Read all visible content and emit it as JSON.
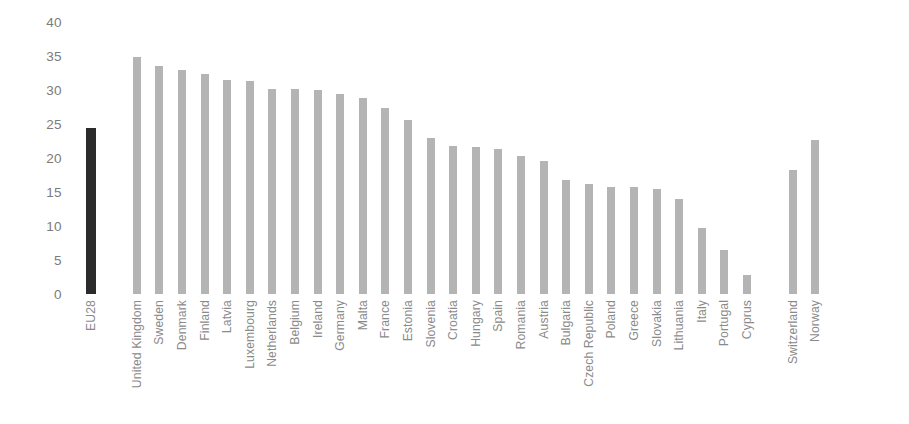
{
  "chart_data": {
    "type": "bar",
    "title": "",
    "subtitle": "",
    "xlabel": "",
    "ylabel": "",
    "ylim": [
      0,
      40
    ],
    "ytick_step": 5,
    "yticks": [
      40,
      35,
      30,
      25,
      20,
      15,
      10,
      5,
      0
    ],
    "ytick_labels": [
      "40",
      "35",
      "30",
      "25",
      "20",
      "15",
      "10",
      "5",
      "0"
    ],
    "grid": false,
    "legend": null,
    "legend_position": "none",
    "orientation": "vertical",
    "tick_label_rotation": -90,
    "colors": {
      "bar": "#b4b4b4",
      "highlight_bar": "#2b2b2b",
      "axis_text": "#7b7b7b",
      "tick_text": "#8a8a8a",
      "background": "#ffffff"
    },
    "categories": [
      "EU28",
      "United Kingdom",
      "Sweden",
      "Denmark",
      "Finland",
      "Latvia",
      "Luxembourg",
      "Netherlands",
      "Belgium",
      "Ireland",
      "Germany",
      "Malta",
      "France",
      "Estonia",
      "Slovenia",
      "Croatia",
      "Hungary",
      "Spain",
      "Romania",
      "Austria",
      "Bulgaria",
      "Czech Republic",
      "Poland",
      "Greece",
      "Slovakia",
      "Lithuania",
      "Italy",
      "Portugal",
      "Cyprus",
      "Switzerland",
      "Norway"
    ],
    "values": [
      24.4,
      34.8,
      33.6,
      33.0,
      32.4,
      31.5,
      31.3,
      30.2,
      30.1,
      30.0,
      29.4,
      28.8,
      27.4,
      25.6,
      22.9,
      21.7,
      21.6,
      21.3,
      20.3,
      19.6,
      16.7,
      16.2,
      15.8,
      15.7,
      15.4,
      13.9,
      9.7,
      6.4,
      2.8,
      18.3,
      22.7
    ],
    "highlight_categories": [
      "EU28"
    ],
    "gap_after_categories": [
      "EU28",
      "Cyprus"
    ]
  }
}
